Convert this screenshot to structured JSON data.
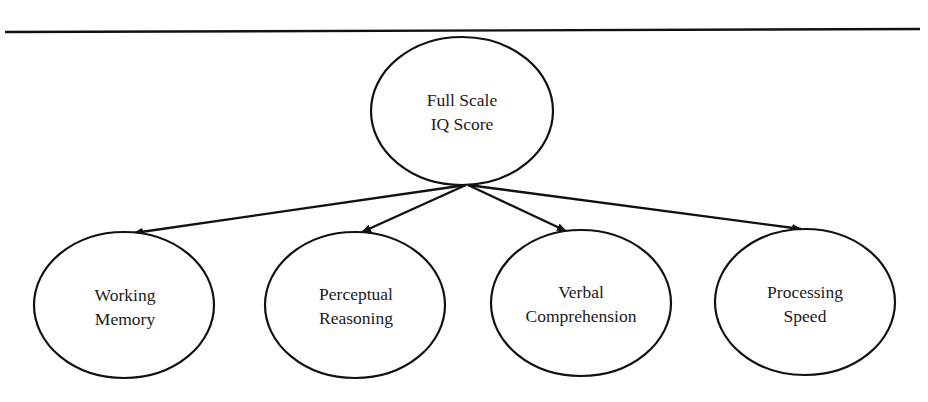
{
  "diagram": {
    "type": "hierarchy",
    "root": {
      "id": "fsiq",
      "line1": "Full Scale",
      "line2": "IQ Score"
    },
    "children": [
      {
        "id": "wm",
        "line1": "Working",
        "line2": "Memory"
      },
      {
        "id": "pr",
        "line1": "Perceptual",
        "line2": "Reasoning"
      },
      {
        "id": "vc",
        "line1": "Verbal",
        "line2": "Comprehension"
      },
      {
        "id": "ps",
        "line1": "Processing",
        "line2": "Speed"
      }
    ],
    "edges": [
      {
        "from": "fsiq",
        "to": "wm"
      },
      {
        "from": "fsiq",
        "to": "pr"
      },
      {
        "from": "fsiq",
        "to": "vc"
      },
      {
        "from": "fsiq",
        "to": "ps"
      }
    ],
    "colors": {
      "stroke": "#111111",
      "text": "#1a1a1a",
      "background": "#ffffff"
    }
  }
}
